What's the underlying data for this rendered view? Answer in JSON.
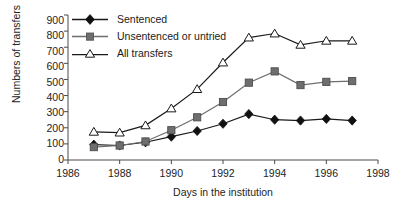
{
  "chart_data": {
    "type": "line",
    "title": "",
    "xlabel": "Days in the institution",
    "ylabel": "Numbers of transfers",
    "x": [
      1987,
      1988,
      1989,
      1990,
      1991,
      1992,
      1993,
      1994,
      1995,
      1996,
      1997
    ],
    "xlim": [
      1986,
      1998
    ],
    "ylim": [
      0,
      900
    ],
    "xticks": [
      "1986",
      "1988",
      "1990",
      "1992",
      "1994",
      "1996",
      "1998"
    ],
    "yticks": [
      "0",
      "100",
      "200",
      "300",
      "400",
      "500",
      "600",
      "700",
      "800",
      "900"
    ],
    "grid": false,
    "legend_position": "top-left",
    "series": [
      {
        "name": "Sentenced",
        "marker": "filled-diamond",
        "color": "#1a1a1a",
        "values": [
          95,
          90,
          110,
          145,
          180,
          225,
          285,
          250,
          245,
          255,
          245
        ]
      },
      {
        "name": "Unsentenced or untried",
        "marker": "filled-square",
        "color": "#6e6e6e",
        "values": [
          80,
          90,
          115,
          185,
          265,
          360,
          480,
          550,
          465,
          485,
          490
        ]
      },
      {
        "name": "All transfers",
        "marker": "open-triangle",
        "color": "#1a1a1a",
        "values": [
          175,
          170,
          215,
          320,
          440,
          605,
          760,
          785,
          715,
          740,
          740
        ]
      }
    ]
  }
}
